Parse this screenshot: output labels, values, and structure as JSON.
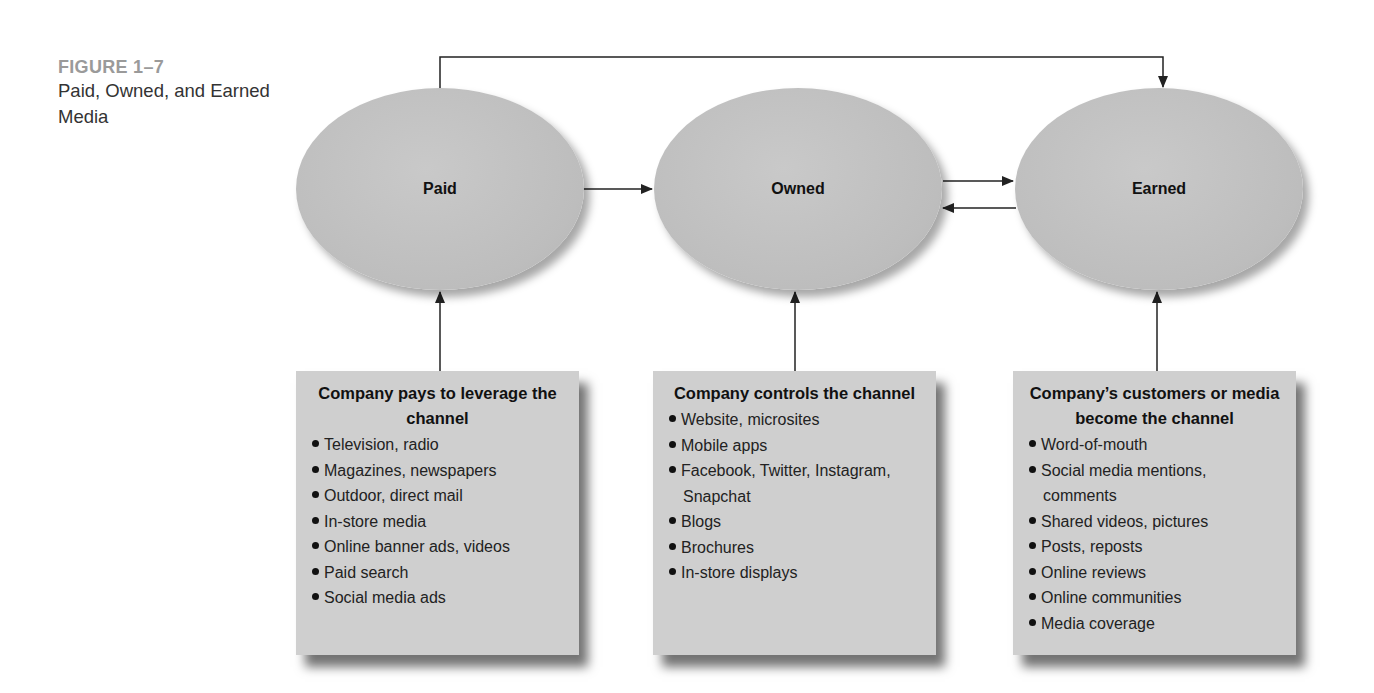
{
  "figure": {
    "label": "FIGURE 1–7",
    "caption": "Paid, Owned, and Earned Media"
  },
  "nodes": [
    {
      "id": "paid",
      "label": "Paid"
    },
    {
      "id": "owned",
      "label": "Owned"
    },
    {
      "id": "earned",
      "label": "Earned"
    }
  ],
  "boxes": [
    {
      "id": "paid",
      "title": "Company pays to leverage the channel",
      "items": [
        "Television, radio",
        "Magazines, newspapers",
        "Outdoor, direct mail",
        "In-store media",
        "Online banner ads, videos",
        "Paid search",
        "Social media ads"
      ]
    },
    {
      "id": "owned",
      "title": "Company controls the channel",
      "items": [
        "Website, microsites",
        "Mobile apps",
        "Facebook, Twitter, Instagram, Snapchat",
        "Blogs",
        "Brochures",
        "In-store displays"
      ]
    },
    {
      "id": "earned",
      "title": "Company’s customers or media become the channel",
      "items": [
        "Word-of-mouth",
        "Social media mentions, comments",
        "Shared videos, pictures",
        "Posts, reposts",
        "Online reviews",
        "Online communities",
        "Media coverage"
      ]
    }
  ],
  "edges": [
    {
      "from": "paid",
      "to": "owned"
    },
    {
      "from": "owned",
      "to": "earned"
    },
    {
      "from": "earned",
      "to": "owned"
    },
    {
      "from": "paid",
      "to": "earned",
      "route": "over-top"
    },
    {
      "from": "box-paid",
      "to": "paid"
    },
    {
      "from": "box-owned",
      "to": "owned"
    },
    {
      "from": "box-earned",
      "to": "earned"
    }
  ],
  "colors": {
    "node_fill": "#c2c2c2",
    "box_fill": "#cfcfcf",
    "line": "#222222",
    "figure_label": "#9a9a9a"
  }
}
